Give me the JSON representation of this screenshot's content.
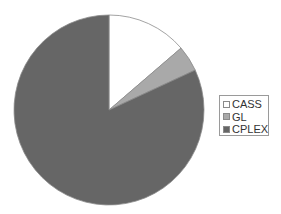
{
  "chart_data": {
    "type": "pie",
    "title": "",
    "categories": [
      "CASS",
      "GL",
      "CPLEX"
    ],
    "values": [
      13.7,
      4.4,
      81.9
    ],
    "unit": "percent (estimated from slice angles)",
    "colors": [
      "#ffffff",
      "#a9a9a9",
      "#666666"
    ],
    "start_angle": "12 o'clock, clockwise",
    "legend": {
      "position": "right",
      "entries": [
        "CASS",
        "GL",
        "CPLEX"
      ]
    }
  },
  "style": {
    "outline": "#8c8c8c"
  }
}
